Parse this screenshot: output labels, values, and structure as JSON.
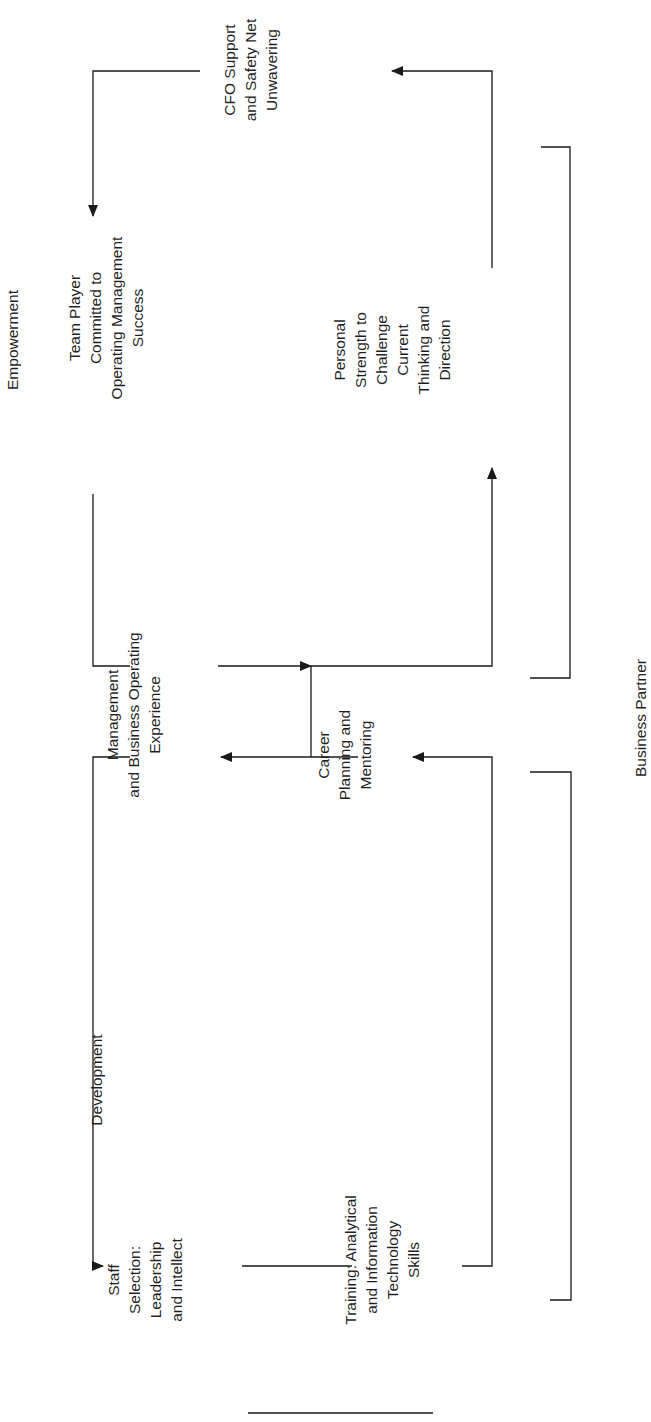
{
  "diagram": {
    "orientation": "rotated-90-ccw",
    "sections": {
      "empowerment": "Empowerment",
      "development": "Development",
      "business_partner": "Business Partner"
    },
    "nodes": {
      "cfo_support": "CFO Support\nand Safety Net\nUnwavering",
      "team_player": "Team Player\nCommitted to\nOperating Management\nSuccess",
      "personal_strength": "Personal\nStrength to\nChallenge\nCurrent\nThinking and\nDirection",
      "mgmt_experience": "Management\nand Business Operating\nExperience",
      "career_planning": "Career\nPlanning and\nMentoring",
      "staff_selection": "Staff\nSelection:\nLeadership\nand Intellect",
      "training": "Training: Analytical\nand Information\nTechnology\nSkills"
    },
    "edges": [
      {
        "from": "personal_strength",
        "to": "cfo_support"
      },
      {
        "from": "cfo_support",
        "to": "team_player"
      },
      {
        "from": "team_player",
        "to": "mgmt_experience"
      },
      {
        "from": "mgmt_experience",
        "to": "personal_strength"
      },
      {
        "from": "career_planning",
        "to": "mgmt_experience"
      },
      {
        "from": "mgmt_experience",
        "to": "staff_selection"
      },
      {
        "from": "staff_selection",
        "to": "training"
      },
      {
        "from": "training",
        "to": "career_planning"
      }
    ],
    "colors": {
      "line": "#1a1a1a",
      "text": "#1f1f1f",
      "background": "#ffffff"
    }
  }
}
